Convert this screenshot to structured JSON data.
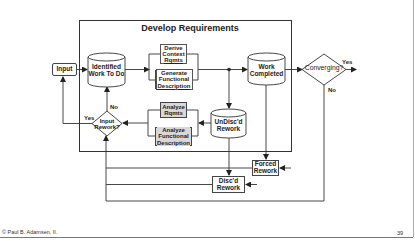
{
  "diagram": {
    "title": "Develop Requirements",
    "nodes": {
      "input": "Input",
      "identified_work": [
        "Identified",
        "Work To Do"
      ],
      "derive_context": [
        "Derive",
        "Context",
        "Rqmts"
      ],
      "generate_functional": [
        "Generate",
        "Functional",
        "Description"
      ],
      "work_completed": [
        "Work",
        "Completed"
      ],
      "converging": "Converging?",
      "input_rework": [
        "Input",
        "Rework?"
      ],
      "analyze_rqmts": [
        "Analyze",
        "Rqmts"
      ],
      "analyze_functional": [
        "Analyze",
        "Functional",
        "Description"
      ],
      "undiscd_rework": [
        "UnDisc'd",
        "Rework"
      ],
      "forced_rework": [
        "Forced",
        "Rework"
      ],
      "discd_rework": [
        "Disc'd",
        "Rework"
      ]
    },
    "edge_labels": {
      "converging_yes": "Yes",
      "converging_no": "No",
      "input_rework_yes": "Yes",
      "input_rework_no": "No"
    }
  },
  "footer": {
    "copyright": "© Paul B. Adamsen, II.",
    "page_number": "39"
  },
  "colors": {
    "line": "#333333",
    "shaded_box": "#d8d8d8",
    "background": "#ffffff"
  }
}
